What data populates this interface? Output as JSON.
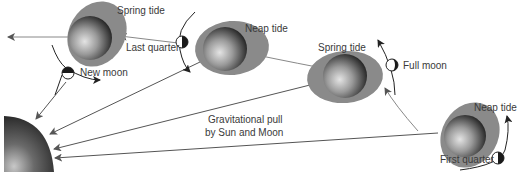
{
  "diagram": {
    "colors": {
      "tide_bulge": "#8a8a8a",
      "earth_dark": "#3a3a3a",
      "earth_light": "#d8d8d8",
      "sun_dark": "#2a2a2a",
      "arrow": "#555555",
      "text": "#3a3a3a"
    },
    "sun": {
      "label": "Sun"
    },
    "labels": {
      "spring_tide_new": "Spring tide",
      "new_moon": "New moon",
      "last_quarter": "Last quarter",
      "neap_tide_last": "Neap tide",
      "spring_tide_full": "Spring tide",
      "full_moon": "Full moon",
      "neap_tide_first": "Neap tide",
      "first_quarter": "First quarter",
      "gravity_line1": "Gravitational pull",
      "gravity_line2": "by Sun and Moon"
    },
    "positions": [
      {
        "phase": "New moon",
        "tide": "Spring tide"
      },
      {
        "phase": "Last quarter",
        "tide": "Neap tide"
      },
      {
        "phase": "Full moon",
        "tide": "Spring tide"
      },
      {
        "phase": "First quarter",
        "tide": "Neap tide"
      }
    ]
  }
}
